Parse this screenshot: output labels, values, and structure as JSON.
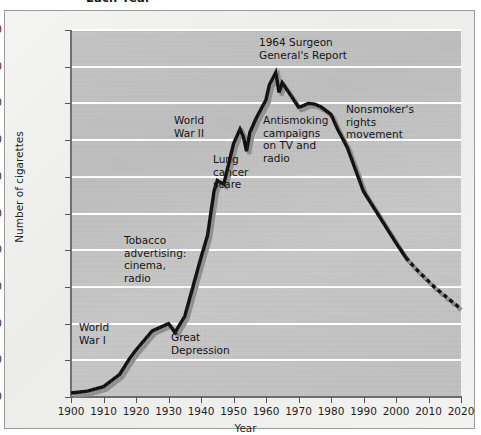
{
  "chart_title": "Each Year",
  "axes": {
    "x_title": "Year",
    "y_title": "Number of cigarettes",
    "x_ticks": [
      "1900",
      "1910",
      "1920",
      "1930",
      "1940",
      "1950",
      "1960",
      "1970",
      "1980",
      "1990",
      "2000",
      "2010",
      "2020"
    ],
    "y_ticks": [
      "0",
      "500",
      "1000",
      "1500",
      "2000",
      "2500",
      "3000",
      "3500",
      "4000",
      "4500",
      "5000"
    ]
  },
  "annotations": [
    {
      "id": "world-war-i",
      "text": "World\nWar I"
    },
    {
      "id": "tobacco-advertising",
      "text": "Tobacco\nadvertising:\ncinema,\nradio"
    },
    {
      "id": "great-depression",
      "text": "Great\nDepression"
    },
    {
      "id": "world-war-ii",
      "text": "World\nWar II"
    },
    {
      "id": "lung-cancer-scare",
      "text": "Lung\ncancer\nscare"
    },
    {
      "id": "surgeon-general",
      "text": "1964 Surgeon\nGeneral's Report"
    },
    {
      "id": "antismoking",
      "text": "Antismoking\ncampaigns\non TV and\nradio"
    },
    {
      "id": "nonsmoker-rights",
      "text": "Nonsmoker's\nrights\nmovement"
    }
  ],
  "colors": {
    "line": "#111111",
    "line_shadow": "#8f8f8f",
    "plot_background": "#c2c2c2",
    "gridline": "#ffffff",
    "frame_border": "#9a9a9a"
  },
  "chart_data": {
    "type": "line",
    "title": "Each Year",
    "xlabel": "Year",
    "ylabel": "Number of cigarettes",
    "xlim": [
      1900,
      2020
    ],
    "ylim": [
      0,
      5000
    ],
    "grid": true,
    "legend": "none",
    "series": [
      {
        "name": "Annual per capita cigarette consumption (observed)",
        "style": "solid",
        "x": [
          1900,
          1905,
          1910,
          1915,
          1918,
          1920,
          1925,
          1930,
          1932,
          1935,
          1940,
          1942,
          1944,
          1945,
          1947,
          1950,
          1952,
          1953,
          1954,
          1955,
          1957,
          1960,
          1961,
          1963,
          1964,
          1965,
          1967,
          1970,
          1971,
          1973,
          1975,
          1977,
          1980,
          1982,
          1985,
          1990,
          1995,
          2000,
          2003
        ],
        "y": [
          55,
          80,
          140,
          310,
          520,
          640,
          900,
          1000,
          880,
          1100,
          1900,
          2200,
          2800,
          2950,
          2900,
          3450,
          3650,
          3550,
          3350,
          3600,
          3800,
          4050,
          4250,
          4420,
          4150,
          4280,
          4150,
          3950,
          3960,
          4000,
          3990,
          3950,
          3850,
          3650,
          3400,
          2800,
          2450,
          2100,
          1900
        ]
      },
      {
        "name": "Projected consumption",
        "style": "dotted",
        "x": [
          2003,
          2006,
          2009,
          2012,
          2015,
          2018,
          2020
        ],
        "y": [
          1900,
          1750,
          1620,
          1490,
          1380,
          1270,
          1200
        ]
      }
    ],
    "event_annotations": [
      {
        "label": "World War I",
        "x": 1917
      },
      {
        "label": "Tobacco advertising: cinema, radio",
        "x": 1927
      },
      {
        "label": "Great Depression",
        "x": 1932
      },
      {
        "label": "World War II",
        "x": 1942
      },
      {
        "label": "Lung cancer scare",
        "x": 1953
      },
      {
        "label": "1964 Surgeon General's Report",
        "x": 1964
      },
      {
        "label": "Antismoking campaigns on TV and radio",
        "x": 1968
      },
      {
        "label": "Nonsmoker's rights movement",
        "x": 1985
      }
    ]
  }
}
